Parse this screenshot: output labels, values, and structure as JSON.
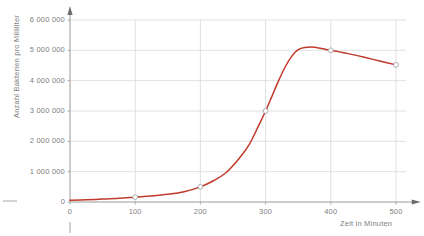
{
  "chart_data": {
    "type": "line",
    "title": "",
    "xlabel": "Zeit in Minuten",
    "ylabel": "Anzahl Bakterien pro Milliliter",
    "xlim": [
      0,
      540
    ],
    "ylim": [
      0,
      6400000
    ],
    "grid": true,
    "legend_position": "none",
    "line_color": "#C0392B",
    "grid_color": "#D8D8D8",
    "axis_color": "#9A9A9A",
    "label_color": "#808080",
    "marker_face_color": "#FFFFFF",
    "marker_edge_color": "#9A9A9A",
    "x_ticks": [
      0,
      100,
      200,
      300,
      400,
      500
    ],
    "x_tick_labels": [
      "0",
      "100",
      "200",
      "300",
      "400",
      "500"
    ],
    "y_ticks": [
      0,
      1000000,
      2000000,
      3000000,
      4000000,
      5000000,
      6000000
    ],
    "y_tick_labels": [
      "0",
      "1 000 000",
      "2 000 000",
      "3 000 000",
      "4 000 000",
      "5 000 000",
      "6 000 000"
    ],
    "series": [
      {
        "name": "Bakterienwachstum",
        "x": [
          0,
          25,
          50,
          75,
          100,
          125,
          150,
          175,
          200,
          220,
          240,
          260,
          275,
          290,
          300,
          310,
          320,
          330,
          340,
          350,
          360,
          375,
          400,
          425,
          450,
          475,
          500
        ],
        "y": [
          60000,
          75000,
          95000,
          120000,
          160000,
          200000,
          255000,
          340000,
          500000,
          700000,
          980000,
          1450000,
          1900000,
          2550000,
          3000000,
          3500000,
          4000000,
          4450000,
          4800000,
          5020000,
          5090000,
          5100000,
          5000000,
          4900000,
          4780000,
          4650000,
          4520000
        ]
      }
    ],
    "markers": [
      {
        "x": 100,
        "y": 160000
      },
      {
        "x": 200,
        "y": 500000
      },
      {
        "x": 300,
        "y": 3000000
      },
      {
        "x": 400,
        "y": 5000000
      },
      {
        "x": 500,
        "y": 4520000
      }
    ]
  }
}
